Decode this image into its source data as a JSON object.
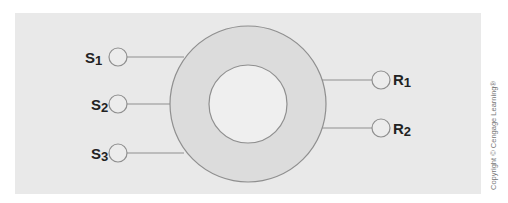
{
  "diagram": {
    "colors": {
      "panel": "#e9e9e9",
      "ring": "#dcdcdc",
      "hole": "#efefef",
      "stroke": "#8f8f8f",
      "node_fill": "#ececec"
    },
    "senders": [
      {
        "letter": "S",
        "sub": "1"
      },
      {
        "letter": "S",
        "sub": "2"
      },
      {
        "letter": "S",
        "sub": "3"
      }
    ],
    "receivers": [
      {
        "letter": "R",
        "sub": "1"
      },
      {
        "letter": "R",
        "sub": "2"
      }
    ]
  },
  "copyright": "Copyright © Cengage Learning®"
}
